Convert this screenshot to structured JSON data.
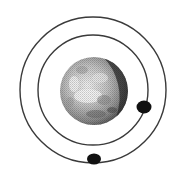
{
  "diagram": {
    "title": "Planet with two orbiting moons",
    "colors": {
      "background": "#ffffff",
      "orbit_stroke": "#3a3a3a",
      "moon_fill": "#111111",
      "planet_light": "#e8e8e8",
      "planet_mid": "#a8a8a8",
      "planet_dark": "#3c3c3c"
    },
    "planet": {
      "label": "planet",
      "cx": 94,
      "cy": 91,
      "r": 34
    },
    "orbits": [
      {
        "label": "inner-orbit",
        "cx": 93,
        "cy": 90,
        "r": 55
      },
      {
        "label": "outer-orbit",
        "cx": 93,
        "cy": 90,
        "r": 73
      }
    ],
    "moons": [
      {
        "label": "inner-moon",
        "cx": 144,
        "cy": 107,
        "rx": 7.5,
        "ry": 6.5
      },
      {
        "label": "outer-moon",
        "cx": 94,
        "cy": 159,
        "rx": 7,
        "ry": 5.5
      }
    ]
  }
}
